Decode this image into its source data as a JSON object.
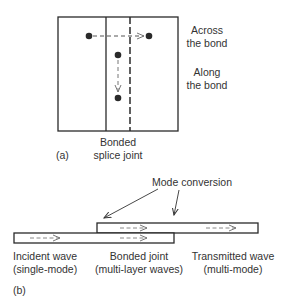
{
  "panel_a": {
    "tag": "(a)",
    "label_across_line1": "Across",
    "label_across_line2": "the bond",
    "label_along_line1": "Along",
    "label_along_line2": "the bond",
    "label_joint_line1": "Bonded",
    "label_joint_line2": "splice joint"
  },
  "panel_b": {
    "tag": "(b)",
    "label_mode_conversion": "Mode conversion",
    "incident_line1": "Incident wave",
    "incident_line2": "(single-mode)",
    "bonded_line1": "Bonded joint",
    "bonded_line2": "(multi-layer waves)",
    "transmitted_line1": "Transmitted wave",
    "transmitted_line2": "(multi-mode)"
  },
  "colors": {
    "stroke": "#2a2a2a",
    "arrow": "#777777"
  }
}
